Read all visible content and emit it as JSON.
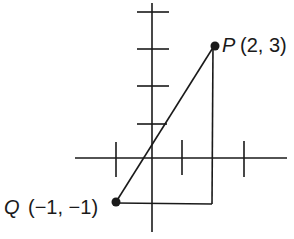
{
  "diagram": {
    "type": "coordinate-plane",
    "stroke_color": "#1a1a1a",
    "background": "#ffffff",
    "axes": {
      "x_axis": {
        "y": 158,
        "x1": 75,
        "x2": 287
      },
      "y_axis": {
        "x": 152,
        "y1": 3,
        "y2": 232
      },
      "x_ticks": [
        116,
        182,
        244
      ],
      "y_ticks": [
        12,
        49,
        86,
        124
      ]
    },
    "points": [
      {
        "name": "P",
        "coords": "(2, 3)",
        "x": 214,
        "y": 46
      },
      {
        "name": "Q",
        "coords": "(−1, −1)",
        "x": 116,
        "y": 202
      }
    ],
    "segments": [
      {
        "name": "PQ",
        "from": "P",
        "to": "Q"
      },
      {
        "name": "vertical-leg",
        "x": 213,
        "y1": 46,
        "y2": 204
      },
      {
        "name": "horizontal-leg",
        "y": 204,
        "x1": 116,
        "x2": 213
      }
    ]
  },
  "labels": {
    "p_name": "P",
    "p_coords": "(2, 3)",
    "q_name": "Q",
    "q_coords": "(−1, −1)"
  }
}
